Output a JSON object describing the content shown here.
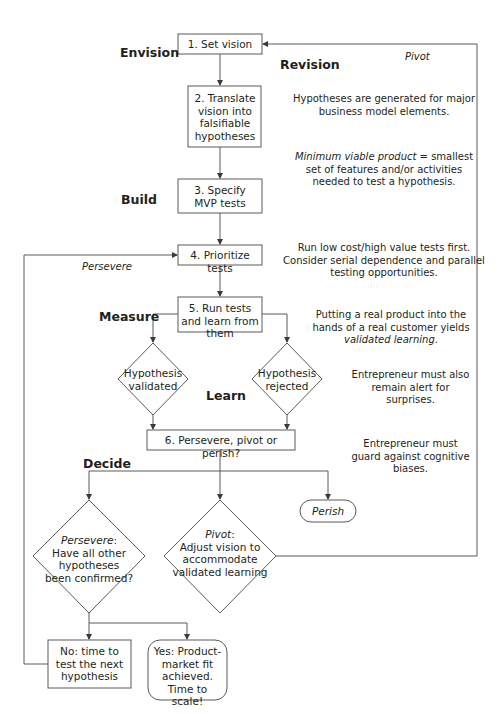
{
  "stages": {
    "envision": "Envision",
    "revision": "Revision",
    "build": "Build",
    "measure": "Measure",
    "learn": "Learn",
    "decide": "Decide"
  },
  "nodes": {
    "set_vision": "1. Set vision",
    "translate_vision": "2. Translate vision into falsifiable hypotheses",
    "specify_mvp": "3. Specify MVP tests",
    "prioritize_tests": "4. Prioritize tests",
    "run_tests": "5. Run tests and learn from them",
    "hypothesis_validated": "Hypothesis validated",
    "hypothesis_rejected": "Hypothesis rejected",
    "decide": "6. Persevere, pivot or perish?",
    "persevere_label": "Persevere",
    "persevere_question": "Have all other hypotheses been confirmed?",
    "pivot_label": "Pivot",
    "pivot_text": "Adjust vision to accommodate validated learning",
    "perish": "Perish",
    "no_branch": "No: time to test the next hypothesis",
    "yes_branch": "Yes: Product-market fit achieved. Time to scale!"
  },
  "edge_labels": {
    "pivot_loop": "Pivot",
    "persevere_loop": "Persevere"
  },
  "notes": {
    "hypotheses": "Hypotheses are generated for major business model elements.",
    "mvp_term": "Minimum viable product",
    "mvp_def": " = smallest set of features and/or activities needed to test a hypothesis.",
    "prioritize": "Run low cost/high value tests first. Consider serial dependence and parallel testing opportunities.",
    "measure_pre": "Putting a real product into the hands of a real customer yields ",
    "measure_term": "validated learning",
    "measure_post": ".",
    "surprises": "Entrepreneur must also remain alert for surprises.",
    "biases": "Entrepreneur must guard against cognitive biases."
  },
  "colors": {
    "stroke": "#5a5a5a",
    "text": "#231f20",
    "background": "#ffffff"
  }
}
